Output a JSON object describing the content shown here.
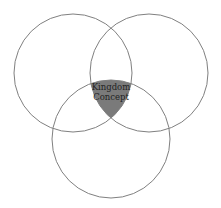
{
  "diagram": {
    "type": "venn",
    "colors": {
      "stroke": "#808080",
      "overlap_fill": "#7a7a7a",
      "text": "#222222",
      "background": "#ffffff"
    },
    "circles": [
      {
        "name": "left",
        "cx": 73,
        "cy": 73,
        "r": 59
      },
      {
        "name": "right",
        "cx": 149,
        "cy": 73,
        "r": 59
      },
      {
        "name": "bottom",
        "cx": 111,
        "cy": 139,
        "r": 59
      }
    ],
    "center_label": {
      "line1": "Kingdom",
      "line2": "Concept"
    }
  }
}
